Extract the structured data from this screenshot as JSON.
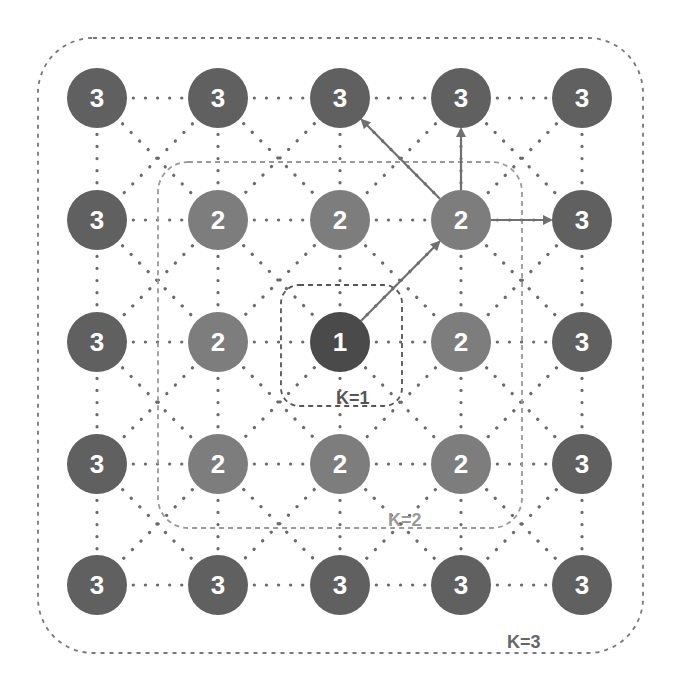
{
  "diagram": {
    "title": "",
    "grid": {
      "rows": 5,
      "cols": 5,
      "col_x": [
        97,
        218,
        340,
        461,
        582
      ],
      "row_y": [
        98,
        220,
        342,
        464,
        585
      ],
      "node_radius": 30
    },
    "nodes": [
      [
        "3",
        "3",
        "3",
        "3",
        "3"
      ],
      [
        "3",
        "2",
        "2",
        "2",
        "3"
      ],
      [
        "3",
        "2",
        "1",
        "2",
        "3"
      ],
      [
        "3",
        "2",
        "2",
        "2",
        "3"
      ],
      [
        "3",
        "3",
        "3",
        "3",
        "3"
      ]
    ],
    "colors": {
      "level_1": "#4a4a4a",
      "level_2": "#7d7d7d",
      "level_3": "#606060",
      "edge_dotted": "#6a6a6a",
      "arrow": "#6f6f6f",
      "box_k1": "#555555",
      "box_k2": "#9a9a9a",
      "box_k3": "#777777",
      "label_k1": "#555555",
      "label_k2": "#9a9a9a",
      "label_k3": "#666666"
    },
    "regions": [
      {
        "id": "k1",
        "label": "K=1",
        "x": 281,
        "y": 285,
        "w": 121,
        "h": 121,
        "r": 18
      },
      {
        "id": "k2",
        "label": "K=2",
        "x": 158,
        "y": 162,
        "w": 364,
        "h": 366,
        "r": 30
      },
      {
        "id": "k3",
        "label": "K=3",
        "x": 38,
        "y": 38,
        "w": 605,
        "h": 615,
        "r": 55
      }
    ],
    "labels": {
      "k1": "K=1",
      "k2": "K=2",
      "k3": "K=3"
    },
    "arrows": [
      {
        "from": [
          2,
          2
        ],
        "to": [
          1,
          3
        ]
      },
      {
        "from": [
          1,
          3
        ],
        "to": [
          0,
          2
        ]
      },
      {
        "from": [
          1,
          3
        ],
        "to": [
          0,
          3
        ]
      },
      {
        "from": [
          1,
          3
        ],
        "to": [
          1,
          4
        ]
      }
    ]
  }
}
